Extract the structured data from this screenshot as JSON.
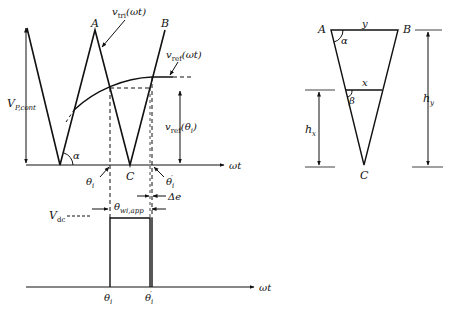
{
  "figure": {
    "left_plot": {
      "y_axis_label": "V",
      "y_axis_label_sub": "P,cont",
      "x_axis_label": "ωt",
      "carrier_label_main": "v",
      "carrier_label_sub": "tri",
      "carrier_label_arg": "(ωt)",
      "reference_label_main": "v",
      "reference_label_sub": "ref",
      "reference_label_arg": "(ωt)",
      "reference_value_main": "v",
      "reference_value_sub": "ref",
      "reference_value_arg": "(θ",
      "reference_value_arg_sub": "i",
      "reference_value_arg_end": ")",
      "point_a": "A",
      "point_b": "B",
      "point_c": "C",
      "angle_alpha": "α",
      "theta_i": "θ",
      "theta_i_sub": "i",
      "theta_i_prime": "θ",
      "theta_i_prime_sub": "i",
      "theta_i_prime_mark": "′",
      "delta_e": "Δe"
    },
    "pulse_plot": {
      "vdc_main": "V",
      "vdc_sub": "dc",
      "width_main": "θ",
      "width_sub": "wi,app",
      "x_axis_label": "ωt",
      "theta_i": "θ",
      "theta_i_sub": "i",
      "theta_i_prime": "θ",
      "theta_i_prime_sub": "i",
      "theta_i_prime_mark": "′"
    },
    "triangle": {
      "point_a": "A",
      "point_b": "B",
      "point_c": "C",
      "top_width": "y",
      "mid_width": "x",
      "angle_alpha": "α",
      "angle_beta": "β",
      "height_x_main": "h",
      "height_x_sub": "x",
      "height_y_main": "h",
      "height_y_sub": "y"
    }
  }
}
